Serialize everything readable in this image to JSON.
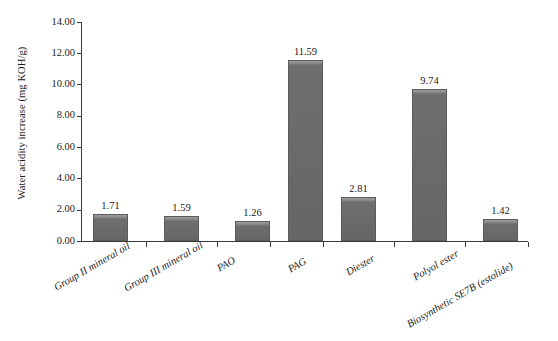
{
  "chart_data": {
    "type": "bar",
    "title": "",
    "xlabel": "",
    "ylabel": "Water acidity increase (mg KOH/g)",
    "ylim": [
      0,
      14
    ],
    "ytick_labels": [
      "14.00",
      "12.00",
      "10.00",
      "8.00",
      "6.00",
      "4.00",
      "2.00",
      "0.00"
    ],
    "ytick_values": [
      14,
      12,
      10,
      8,
      6,
      4,
      2,
      0
    ],
    "grid": false,
    "legend": "none",
    "categories": [
      "Group II mineral oil",
      "Group III mineral oil",
      "PAO",
      "PAG",
      "Diester",
      "Polyol ester",
      "Biosynthetic SE7B (estolide)"
    ],
    "values": [
      1.71,
      1.59,
      1.26,
      11.59,
      2.81,
      9.74,
      1.42
    ],
    "data_labels": [
      "1.71",
      "1.59",
      "1.26",
      "11.59",
      "2.81",
      "9.74",
      "1.42"
    ],
    "series": [
      {
        "name": "Water acidity increase",
        "values": [
          1.71,
          1.59,
          1.26,
          11.59,
          2.81,
          9.74,
          1.42
        ]
      }
    ],
    "colors": {
      "bar_fill": "#6e6e6e",
      "bar_edge": "#5c5c5c",
      "axis": "#3a3a3a",
      "text": "#1b1b1b",
      "background": "#ffffff"
    }
  }
}
